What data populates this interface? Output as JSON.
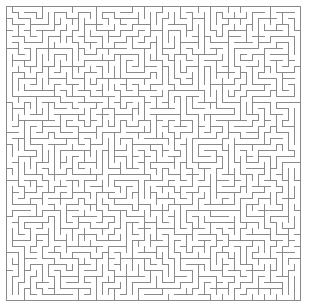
{
  "figure": {
    "kind": "maze-puzzle",
    "width_px": 309,
    "height_px": 307,
    "background_color": "#ffffff"
  },
  "maze": {
    "type": "orthogonal-perfect-maze",
    "columns": 49,
    "rows": 49,
    "cell_size_px": 6,
    "wall_thickness_px": 1,
    "wall_color": "#8a8a8a",
    "passage_color": "#ffffff",
    "origin_x_px": 6,
    "origin_y_px": 6,
    "border": {
      "top_closed": true,
      "bottom_closed": true,
      "left_closed": true,
      "right_closed": true
    },
    "entrance": null,
    "exit": null,
    "generation": {
      "algorithm": "randomized-depth-first-search",
      "seed": 20240117,
      "braid": false
    }
  }
}
